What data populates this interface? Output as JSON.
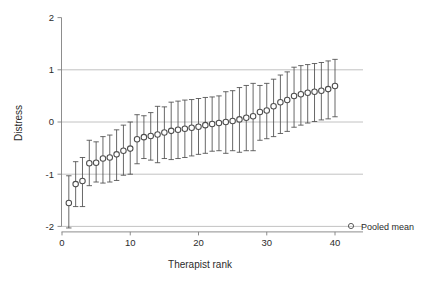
{
  "chart_data": {
    "type": "scatter",
    "title": "",
    "xlabel": "Therapist rank",
    "ylabel": "Distress",
    "xlim": [
      -1,
      42
    ],
    "ylim": [
      -2,
      2
    ],
    "xticks": [
      0,
      10,
      20,
      30,
      40
    ],
    "xtick_labels": [
      "0",
      "10",
      "20",
      "30",
      "40"
    ],
    "yticks": [
      2,
      1,
      0,
      -1,
      -2
    ],
    "ytick_labels": [
      "2",
      "1",
      "0",
      "-1",
      "-2"
    ],
    "grid": "horizontal gridlines at y = 1, 0, -1, -2",
    "legend_position": "right",
    "legend": [
      {
        "label": "Pooled mean",
        "marker": "open-circle"
      }
    ],
    "marker": "open-circle",
    "error_bar_style": "vertical line with horizontal caps",
    "series": [
      {
        "name": "Pooled mean",
        "x": [
          1,
          2,
          3,
          4,
          5,
          6,
          7,
          8,
          9,
          10,
          11,
          12,
          13,
          14,
          15,
          16,
          17,
          18,
          19,
          20,
          21,
          22,
          23,
          24,
          25,
          26,
          27,
          28,
          29,
          30,
          31,
          32,
          33,
          34,
          35,
          36,
          37,
          38,
          39,
          40
        ],
        "values": [
          -1.55,
          -1.19,
          -1.13,
          -0.79,
          -0.78,
          -0.7,
          -0.68,
          -0.62,
          -0.55,
          -0.51,
          -0.33,
          -0.29,
          -0.27,
          -0.24,
          -0.2,
          -0.17,
          -0.15,
          -0.13,
          -0.11,
          -0.09,
          -0.06,
          -0.04,
          -0.02,
          0.0,
          0.02,
          0.05,
          0.08,
          0.11,
          0.19,
          0.22,
          0.3,
          0.38,
          0.42,
          0.5,
          0.53,
          0.56,
          0.58,
          0.6,
          0.63,
          0.69
        ],
        "ci_lower": [
          -2.03,
          -1.62,
          -1.62,
          -1.22,
          -1.15,
          -1.17,
          -1.15,
          -1.12,
          -1.02,
          -1.0,
          -0.8,
          -0.7,
          -0.73,
          -0.78,
          -0.7,
          -0.72,
          -0.7,
          -0.68,
          -0.65,
          -0.62,
          -0.6,
          -0.56,
          -0.55,
          -0.6,
          -0.55,
          -0.58,
          -0.55,
          -0.55,
          -0.35,
          -0.32,
          -0.28,
          -0.22,
          -0.18,
          -0.1,
          -0.06,
          -0.02,
          0.01,
          0.04,
          0.06,
          0.1
        ],
        "ci_upper": [
          -1.03,
          -0.76,
          -0.68,
          -0.35,
          -0.38,
          -0.28,
          -0.25,
          -0.15,
          -0.06,
          0.0,
          0.14,
          0.12,
          0.18,
          0.3,
          0.29,
          0.38,
          0.4,
          0.42,
          0.43,
          0.45,
          0.47,
          0.48,
          0.5,
          0.58,
          0.6,
          0.66,
          0.7,
          0.74,
          0.7,
          0.74,
          0.82,
          0.9,
          0.96,
          1.05,
          1.08,
          1.1,
          1.12,
          1.14,
          1.17,
          1.2
        ]
      }
    ],
    "colors": {
      "marker_stroke": "#4d4d4d",
      "error_bar": "#4d4d4d",
      "gridline": "#b3b3b3",
      "axis": "#808080",
      "text": "#2b2b2b"
    }
  }
}
